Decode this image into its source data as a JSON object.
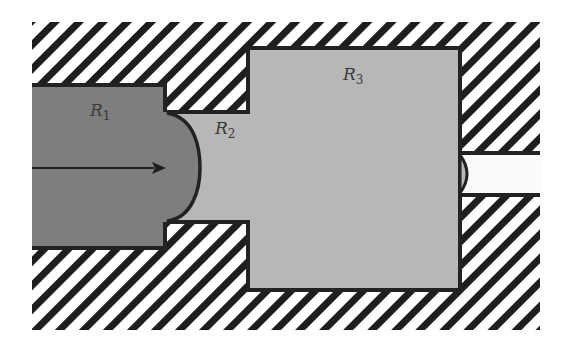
{
  "diagram": {
    "type": "fluid-flow-regions",
    "regions": [
      {
        "id": "R1",
        "label": "R",
        "subscript": "1",
        "fill": "#7e7e7e"
      },
      {
        "id": "R2",
        "label": "R",
        "subscript": "2",
        "fill": "#b7b7b7"
      },
      {
        "id": "R3",
        "label": "R",
        "subscript": "3",
        "fill": "#b7b7b7"
      }
    ],
    "outlet": {
      "fill": "#fafafa"
    },
    "walls": {
      "pattern": "diagonal-hatch",
      "stroke": "#1e1e1e",
      "background": "#ffffff"
    },
    "arrow": {
      "direction": "right",
      "color": "#1e1e1e"
    },
    "colors": {
      "outline": "#222222",
      "hatch": "#1e1e1e",
      "dark_fluid": "#7e7e7e",
      "light_fluid": "#b7b7b7"
    }
  }
}
